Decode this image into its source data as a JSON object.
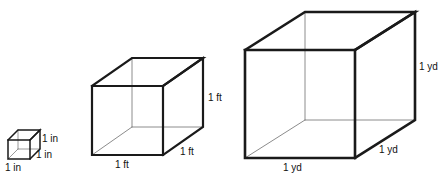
{
  "figure": {
    "background_color": "#ffffff",
    "edge_color": "#1a1a1a",
    "hidden_edge_color": "#8c8c8c",
    "label_color": "#111111",
    "cubes": [
      {
        "id": "cubic-inch",
        "unit": "in",
        "size_label": "1 in",
        "labels": {
          "right": "1 in",
          "bottom_right": "1 in",
          "bottom_left": "1 in"
        }
      },
      {
        "id": "cubic-foot",
        "unit": "ft",
        "size_label": "1 ft",
        "labels": {
          "right": "1 ft",
          "bottom_right": "1 ft",
          "bottom_left": "1 ft"
        }
      },
      {
        "id": "cubic-yard",
        "unit": "yd",
        "size_label": "1 yd",
        "labels": {
          "right": "1 yd",
          "bottom_right": "1 yd",
          "bottom_left": "1 yd"
        }
      }
    ]
  }
}
